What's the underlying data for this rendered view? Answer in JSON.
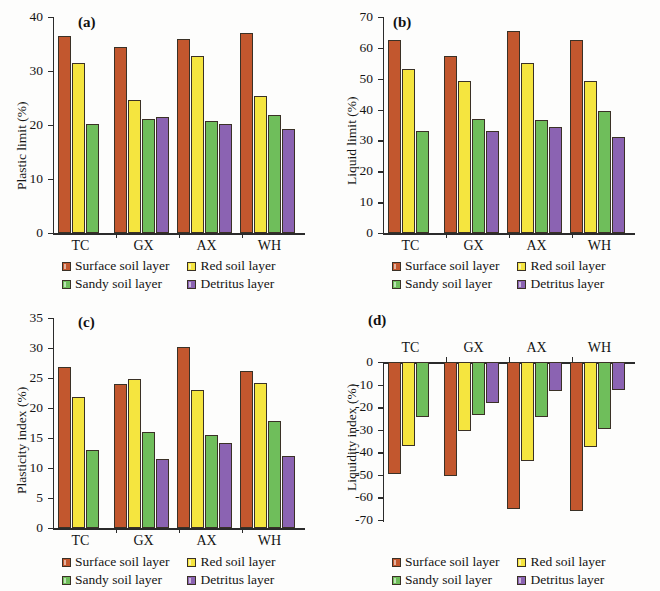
{
  "figure": {
    "background": "#fdfdfc",
    "series_colors": {
      "surface": "#c2572e",
      "red": "#f5e53f",
      "sandy": "#6fbe5b",
      "detritus": "#8b63b2"
    }
  },
  "legend": {
    "items": [
      {
        "key": "surface",
        "label": "Surface soil layer"
      },
      {
        "key": "red",
        "label": "Red soil layer"
      },
      {
        "key": "sandy",
        "label": "Sandy soil layer"
      },
      {
        "key": "detritus",
        "label": "Detritus layer"
      }
    ]
  },
  "chart_data": [
    {
      "panel": "a",
      "tag": "(a)",
      "type": "bar",
      "title": "",
      "xlabel": "",
      "ylabel": "Plastic limit (%)",
      "categories": [
        "TC",
        "GX",
        "AX",
        "WH"
      ],
      "ylim": [
        0,
        40
      ],
      "yticks": [
        0,
        10,
        20,
        30,
        40
      ],
      "ytick_labels": [
        "0",
        "10",
        "20",
        "30",
        "40"
      ],
      "grid": false,
      "legend_position": "below-axes",
      "series": [
        {
          "name": "Surface soil layer",
          "key": "surface",
          "values": [
            36.4,
            34.4,
            36.0,
            37.0
          ]
        },
        {
          "name": "Red soil layer",
          "key": "red",
          "values": [
            31.5,
            24.7,
            32.7,
            25.4
          ]
        },
        {
          "name": "Sandy soil layer",
          "key": "sandy",
          "values": [
            20.1,
            21.2,
            20.8,
            21.9
          ]
        },
        {
          "name": "Detritus layer",
          "key": "detritus",
          "values": [
            null,
            21.5,
            20.2,
            19.2
          ]
        }
      ]
    },
    {
      "panel": "b",
      "tag": "(b)",
      "type": "bar",
      "title": "",
      "xlabel": "",
      "ylabel": "Liquid limit (%)",
      "categories": [
        "TC",
        "GX",
        "AX",
        "WH"
      ],
      "ylim": [
        0,
        70
      ],
      "yticks": [
        0,
        10,
        20,
        30,
        40,
        50,
        60,
        70
      ],
      "ytick_labels": [
        "0",
        "10",
        "20",
        "30",
        "40",
        "50",
        "60",
        "70"
      ],
      "grid": false,
      "legend_position": "below-axes",
      "series": [
        {
          "name": "Surface soil layer",
          "key": "surface",
          "values": [
            62.4,
            57.5,
            65.5,
            62.4
          ]
        },
        {
          "name": "Red soil layer",
          "key": "red",
          "values": [
            53.0,
            49.4,
            55.2,
            49.4
          ]
        },
        {
          "name": "Sandy soil layer",
          "key": "sandy",
          "values": [
            33.2,
            37.0,
            36.5,
            39.6
          ]
        },
        {
          "name": "Detritus layer",
          "key": "detritus",
          "values": [
            null,
            33.1,
            34.2,
            31.2
          ]
        }
      ]
    },
    {
      "panel": "c",
      "tag": "(c)",
      "type": "bar",
      "title": "",
      "xlabel": "",
      "ylabel": "Plasticity index (%)",
      "categories": [
        "TC",
        "GX",
        "AX",
        "WH"
      ],
      "ylim": [
        0,
        35
      ],
      "yticks": [
        0,
        5,
        10,
        15,
        20,
        25,
        30,
        35
      ],
      "ytick_labels": [
        "0",
        "5",
        "10",
        "15",
        "20",
        "25",
        "30",
        "35"
      ],
      "grid": false,
      "legend_position": "below-axes",
      "series": [
        {
          "name": "Surface soil layer",
          "key": "surface",
          "values": [
            26.8,
            24.0,
            30.1,
            26.1
          ]
        },
        {
          "name": "Red soil layer",
          "key": "red",
          "values": [
            21.8,
            24.8,
            23.0,
            24.1
          ]
        },
        {
          "name": "Sandy soil layer",
          "key": "sandy",
          "values": [
            13.0,
            16.0,
            15.5,
            17.9
          ]
        },
        {
          "name": "Detritus layer",
          "key": "detritus",
          "values": [
            null,
            11.5,
            14.2,
            12.0
          ]
        }
      ]
    },
    {
      "panel": "d",
      "tag": "(d)",
      "type": "bar",
      "title": "",
      "xlabel": "",
      "ylabel": "Liquidity index (%)",
      "categories": [
        "TC",
        "GX",
        "AX",
        "WH"
      ],
      "ylim": [
        -70,
        0
      ],
      "yticks": [
        0,
        -10,
        -20,
        -30,
        -40,
        -50,
        -60,
        -70
      ],
      "ytick_labels": [
        "0",
        "-10",
        "-20",
        "-30",
        "-40",
        "-50",
        "-60",
        "-70"
      ],
      "grid": false,
      "category_axis_position": "top",
      "legend_position": "below-axes",
      "series": [
        {
          "name": "Surface soil layer",
          "key": "surface",
          "values": [
            -49.5,
            -50.5,
            -65.0,
            -66.0
          ]
        },
        {
          "name": "Red soil layer",
          "key": "red",
          "values": [
            -37.0,
            -30.5,
            -44.0,
            -37.5
          ]
        },
        {
          "name": "Sandy soil layer",
          "key": "sandy",
          "values": [
            -24.5,
            -23.5,
            -24.5,
            -29.5
          ]
        },
        {
          "name": "Detritus layer",
          "key": "detritus",
          "values": [
            null,
            -18.0,
            -13.0,
            -12.5
          ]
        }
      ]
    }
  ]
}
